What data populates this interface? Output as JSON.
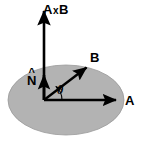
{
  "figure": {
    "width": 141,
    "height": 144,
    "background_color": "#ffffff"
  },
  "plane": {
    "name": "plane-ellipse",
    "fill_color": "#b3b3b3",
    "stroke_color": "#8c8c8c",
    "center_x": 66,
    "center_y": 100,
    "radius_x": 58,
    "radius_y": 35
  },
  "origin": {
    "x": 44,
    "y": 100
  },
  "vectors": [
    {
      "id": "axb",
      "label": "A",
      "operator": "x",
      "label2": "B",
      "full_label": "A x B",
      "color": "#000000",
      "from_x": 44,
      "from_y": 100,
      "to_x": 44,
      "to_y": 9
    },
    {
      "id": "n-hat",
      "label": "N",
      "accent": "^",
      "full_label": "N̂",
      "color": "#000000",
      "from_x": 44,
      "from_y": 100,
      "to_x": 44,
      "to_y": 72
    },
    {
      "id": "b",
      "label": "B",
      "color": "#000000",
      "from_x": 44,
      "from_y": 100,
      "to_x": 88,
      "to_y": 66
    },
    {
      "id": "a",
      "label": "A",
      "color": "#000000",
      "from_x": 44,
      "from_y": 100,
      "to_x": 118,
      "to_y": 100
    }
  ],
  "angle": {
    "id": "theta",
    "label": "θ",
    "color": "#000000",
    "arc_radius": 18,
    "between": [
      "a",
      "b"
    ]
  }
}
